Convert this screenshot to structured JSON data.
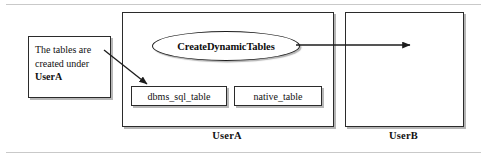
{
  "figure": {
    "rules": {
      "top": "divider",
      "bottom": "divider"
    }
  },
  "containers": [
    {
      "id": "user-a",
      "caption": "UserA"
    },
    {
      "id": "user-b",
      "caption": "UserB"
    }
  ],
  "procedure": {
    "label": "CreateDynamicTables",
    "shape": "ellipse"
  },
  "tables": [
    {
      "id": "dbms",
      "label": "dbms_sql_table"
    },
    {
      "id": "native",
      "label": "native_table"
    }
  ],
  "callout": {
    "line1": "The tables are",
    "line2": "created under",
    "emphasis": "UserA"
  },
  "arrows": [
    {
      "name": "callout-to-dbms-table",
      "from": "callout-box",
      "to": "dbms_sql_table",
      "style": "solid-thin-arrowhead"
    },
    {
      "name": "procedure-to-user-b",
      "from": "CreateDynamicTables",
      "to": "UserB",
      "style": "solid-thin-arrowhead"
    }
  ],
  "colors": {
    "stroke": "#2b2b2b",
    "text": "#111111",
    "background": "#ffffff",
    "rule": "#c9c9c9",
    "shadow": "#7d7d7d"
  }
}
